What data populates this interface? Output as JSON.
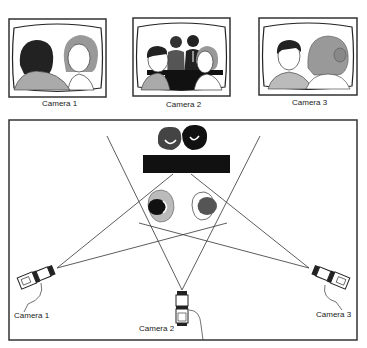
{
  "monitors": [
    {
      "label": "Camera 1",
      "scene": "over-shoulder view: back of dark-haired man, facing woman"
    },
    {
      "label": "Camera 2",
      "scene": "wide view: two people facing each other at table, two people standing behind"
    },
    {
      "label": "Camera 3",
      "scene": "over-shoulder view: back of woman's head, facing man"
    }
  ],
  "floorplan": {
    "cameras": [
      {
        "label": "Camera 1"
      },
      {
        "label": "Camera 2"
      },
      {
        "label": "Camera 3"
      }
    ],
    "elements": [
      "table",
      "standing-people-pair",
      "seated-person-left",
      "seated-person-right",
      "view-lines"
    ]
  }
}
